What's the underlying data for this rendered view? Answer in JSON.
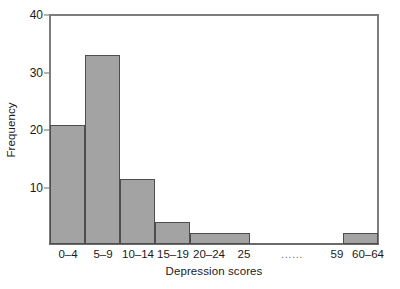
{
  "chart_data": {
    "type": "bar",
    "title": "",
    "subtitle": "",
    "xlabel": "Depression scores",
    "ylabel": "Frequency",
    "categories": [
      "0–4",
      "5–9",
      "10–14",
      "15–19",
      "20–24",
      "25",
      "......",
      "59",
      "60–64"
    ],
    "values": [
      22,
      35,
      12,
      4,
      2,
      0,
      0,
      0,
      2
    ],
    "bars": [
      {
        "category": "0–4",
        "value": 22,
        "drawn": true
      },
      {
        "category": "5–9",
        "value": 35,
        "drawn": true
      },
      {
        "category": "10–14",
        "value": 12,
        "drawn": true
      },
      {
        "category": "15–19",
        "value": 4,
        "drawn": true
      },
      {
        "category": "20–24",
        "value": 2,
        "drawn": true
      },
      {
        "category": "25",
        "value": 0,
        "drawn": false
      },
      {
        "category": "......",
        "value": 0,
        "drawn": false
      },
      {
        "category": "59",
        "value": 0,
        "drawn": false
      },
      {
        "category": "60–64",
        "value": 2,
        "drawn": true
      }
    ],
    "ylim": [
      0,
      40
    ],
    "yticks": [
      10,
      20,
      30,
      40
    ],
    "ytick_labels": [
      "10",
      "20",
      "30",
      "40"
    ],
    "xtick_labels": [
      "0–4",
      "5–9",
      "10–14",
      "15–19",
      "20–24",
      "25",
      "......",
      "59",
      "60–64"
    ],
    "grid": false,
    "legend": null,
    "colors": {
      "bar_fill": "#a3a3a3",
      "bar_edge": "#4d4d4d",
      "axis": "#6b6b6b",
      "frame": "#7d7d7d",
      "text": "#1a1a1a",
      "background": "#ffffff"
    }
  },
  "axes": {
    "y": {
      "label": "Frequency",
      "ticks": [
        {
          "label": "40",
          "value": 40
        },
        {
          "label": "30",
          "value": 30
        },
        {
          "label": "20",
          "value": 20
        },
        {
          "label": "10",
          "value": 10
        }
      ]
    },
    "x": {
      "label": "Depression scores",
      "ticks": [
        {
          "label": "0–4"
        },
        {
          "label": "5–9"
        },
        {
          "label": "10–14"
        },
        {
          "label": "15–19"
        },
        {
          "label": "20–24"
        },
        {
          "label": "25"
        },
        {
          "label": "......"
        },
        {
          "label": "59"
        },
        {
          "label": "60–64"
        }
      ]
    }
  }
}
